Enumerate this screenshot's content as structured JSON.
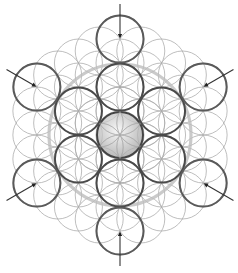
{
  "diagram": {
    "pattern": "flower-of-life",
    "circle_count": {
      "inner_ring": 6,
      "outer_ring": 6,
      "center": 1
    },
    "arrows": {
      "count": 6,
      "direction": "inward",
      "targets": [
        "top",
        "upper-right",
        "lower-right",
        "bottom",
        "lower-left",
        "upper-left"
      ]
    },
    "colors": {
      "background": "#ffffff",
      "grid_stroke": "#a9a9a9",
      "highlight_stroke": "#4a4a4a",
      "ring_stroke": "#bdbdbd",
      "sphere_light": "#f4f4f4",
      "sphere_dark": "#9a9a9a",
      "arrow": "#333333"
    }
  }
}
